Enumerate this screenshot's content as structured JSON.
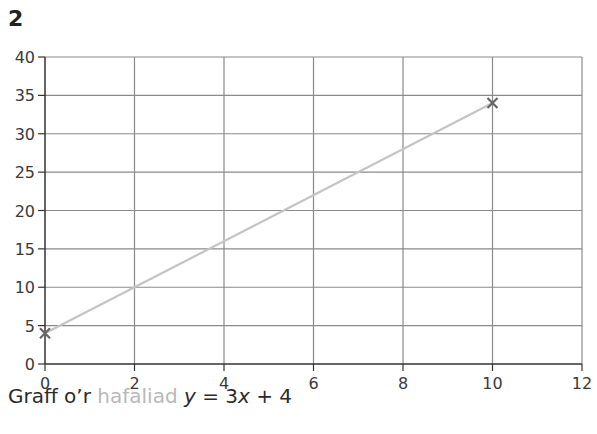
{
  "question_number": "2",
  "caption": {
    "prefix": "Graff o’r ",
    "highlight": "hafaliad",
    "eq_y": "y",
    "eq_mid": " = 3",
    "eq_x": "x",
    "eq_end": " + 4"
  },
  "colors": {
    "grid": "#8a8a8a",
    "axis": "#333333",
    "line": "#c4c4c4",
    "marker": "#666666",
    "highlight_text": "#b8b8b8"
  },
  "chart_data": {
    "type": "line",
    "title": "",
    "caption": "Graff o’r hafaliad y = 3x + 4",
    "xlabel": "",
    "ylabel": "",
    "xlim": [
      0,
      12
    ],
    "ylim": [
      0,
      40
    ],
    "x_ticks": [
      0,
      2,
      4,
      6,
      8,
      10,
      12
    ],
    "y_ticks": [
      0,
      5,
      10,
      15,
      20,
      25,
      30,
      35,
      40
    ],
    "grid": true,
    "series": [
      {
        "name": "y = 3x + 4",
        "x": [
          0,
          10
        ],
        "values": [
          4,
          34
        ],
        "marker": "x"
      }
    ]
  }
}
